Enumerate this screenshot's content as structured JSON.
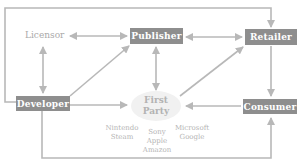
{
  "diagram": {
    "nodes": {
      "licensor": "Licensor",
      "publisher": "Publisher",
      "retailer": "Retailer",
      "developer": "Developer",
      "first_party": {
        "line1": "First",
        "line2": "Party"
      },
      "consumer": "Consumer"
    },
    "first_party_examples": {
      "left": [
        "Nintendo",
        "Steam"
      ],
      "center": [
        "Sony",
        "Apple",
        "Amazon"
      ],
      "right": [
        "Microsoft",
        "Google"
      ]
    },
    "edges": [
      {
        "from": "Licensor",
        "to": "Publisher",
        "type": "bidirectional"
      },
      {
        "from": "Licensor",
        "to": "Developer",
        "type": "bidirectional"
      },
      {
        "from": "Developer",
        "to": "Publisher",
        "type": "directed"
      },
      {
        "from": "Publisher",
        "to": "Retailer",
        "type": "bidirectional"
      },
      {
        "from": "Publisher",
        "to": "First Party",
        "type": "bidirectional"
      },
      {
        "from": "First Party",
        "to": "Retailer",
        "type": "directed"
      },
      {
        "from": "Developer",
        "to": "First Party",
        "type": "directed"
      },
      {
        "from": "Consumer",
        "to": "First Party",
        "type": "directed"
      },
      {
        "from": "Retailer",
        "to": "Consumer",
        "type": "directed"
      },
      {
        "from": "Developer",
        "to": "Retailer",
        "type": "directed",
        "route": "top loop"
      },
      {
        "from": "Developer",
        "to": "Consumer",
        "type": "directed",
        "route": "bottom loop"
      }
    ],
    "colors": {
      "box_fill": "#8e8e8e",
      "box_text": "#ffffff",
      "arrow": "#b8b8b8",
      "muted_text": "#a9a9a9",
      "ellipse_fill": "#f1f1f1"
    }
  }
}
